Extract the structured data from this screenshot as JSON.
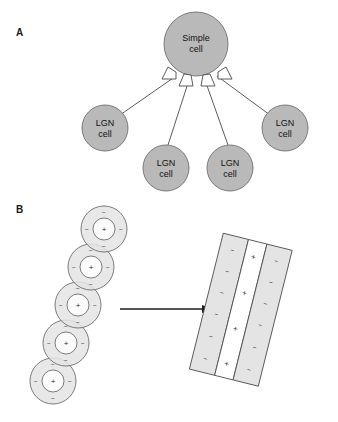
{
  "figure": {
    "background_color": "#ffffff",
    "width": 338,
    "height": 422
  },
  "panels": [
    {
      "id": "A",
      "label": "A",
      "label_x": 16,
      "label_y": 36,
      "description": "Wiring diagram: four LGN cells converge onto one simple cell"
    },
    {
      "id": "B",
      "label": "B",
      "label_x": 16,
      "label_y": 213,
      "description": "Row of aligned center-surround LGN receptive fields sums into an elongated oriented simple-cell receptive field"
    }
  ],
  "panel_a": {
    "simple_cell": {
      "label_line1": "Simple",
      "label_line2": "cell",
      "cx": 196,
      "cy": 44,
      "r": 32,
      "fill": "#b9b9b9",
      "stroke": "#6e6e6e"
    },
    "lgn_cells": [
      {
        "label_line1": "LGN",
        "label_line2": "cell",
        "cx": 105,
        "cy": 128,
        "r": 23
      },
      {
        "label_line1": "LGN",
        "label_line2": "cell",
        "cx": 166,
        "cy": 168,
        "r": 23
      },
      {
        "label_line1": "LGN",
        "label_line2": "cell",
        "cx": 230,
        "cy": 168,
        "r": 23
      },
      {
        "label_line1": "LGN",
        "label_line2": "cell",
        "cx": 285,
        "cy": 128,
        "r": 23
      }
    ],
    "synapse_count": 4,
    "cell_fill": "#b9b9b9",
    "cell_stroke": "#6e6e6e",
    "axon_color": "#4a4a4a"
  },
  "panel_b": {
    "receptive_fields": {
      "count": 5,
      "outer_radius": 23,
      "inner_radius": 11,
      "center_sign": "+",
      "surround_sign": "−",
      "surround_sign_count": 4,
      "surround_fill": "#e4e4e4",
      "center_fill": "#fbfbfb",
      "stroke": "#5d5d5d",
      "centers": [
        {
          "cx": 104,
          "cy": 229
        },
        {
          "cx": 91,
          "cy": 267
        },
        {
          "cx": 78,
          "cy": 305
        },
        {
          "cx": 66,
          "cy": 343
        },
        {
          "cx": 53,
          "cy": 381
        }
      ]
    },
    "arrow": {
      "x1": 120,
      "y1": 309,
      "x2": 212,
      "y2": 309,
      "color": "#1d1d1d",
      "direction": "right"
    },
    "simple_cell_field": {
      "rotation_deg": 14,
      "off_region_sign": "−",
      "on_region_sign": "+",
      "off_fill": "#e4e4e4",
      "on_fill": "#ffffff",
      "stroke": "#4f4f4f",
      "strip_labels": [
        "−",
        "+",
        "−"
      ],
      "off_left_sign_count": 6,
      "on_center_sign_count": 4,
      "off_right_sign_count": 6
    }
  }
}
